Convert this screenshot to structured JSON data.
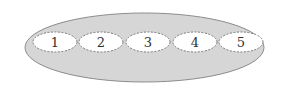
{
  "diagram": {
    "container": {
      "shape": "ellipse",
      "cx": 144.5,
      "cy": 47.5,
      "rx": 119.5,
      "ry": 34.5,
      "fill": "#d6d6d6",
      "stroke": "#8c8c8c"
    },
    "items": [
      {
        "label": "1",
        "cx": 55,
        "cy": 42
      },
      {
        "label": "2",
        "cx": 101,
        "cy": 42
      },
      {
        "label": "3",
        "cx": 148,
        "cy": 42
      },
      {
        "label": "4",
        "cx": 195,
        "cy": 42
      },
      {
        "label": "5",
        "cx": 241,
        "cy": 42
      }
    ],
    "item_style": {
      "rx": 22,
      "ry": 10,
      "fill": "#ffffff",
      "stroke": "#7a7a7a",
      "dash": "2,1.5"
    }
  }
}
